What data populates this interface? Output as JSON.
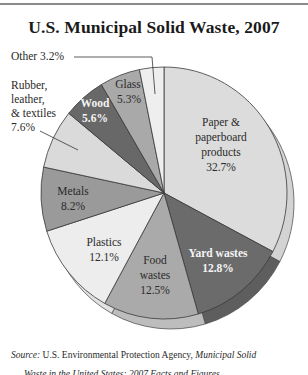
{
  "header": {
    "title": "U.S. Municipal Solid Waste, 2007"
  },
  "external_labels": {
    "other": "Other 3.2%",
    "rubber_line1": "Rubber,",
    "rubber_line2": "leather,",
    "rubber_line3": "& textiles",
    "rubber_line4": "7.6%"
  },
  "slice_labels": {
    "paper_line1": "Paper &",
    "paper_line2": "paperboard",
    "paper_line3": "products",
    "paper_line4": "32.7%",
    "yard_line1": "Yard wastes",
    "yard_line2": "12.8%",
    "food_line1": "Food",
    "food_line2": "wastes",
    "food_line3": "12.5%",
    "plastics_line1": "Plastics",
    "plastics_line2": "12.1%",
    "metals_line1": "Metals",
    "metals_line2": "8.2%",
    "wood_line1": "Wood",
    "wood_line2": "5.6%",
    "glass_line1": "Glass",
    "glass_line2": "5.3%"
  },
  "footer": {
    "source_label": "Source:",
    "source_text": " U.S. Environmental Protection Agency, ",
    "source_title": "Municipal Solid",
    "source_line2": "Waste in the United States: 2007 Facts and Figures"
  },
  "chart_data": {
    "type": "pie",
    "title": "U.S. Municipal Solid Waste, 2007",
    "start_angle_deg": 0,
    "direction": "clockwise",
    "unit": "%",
    "categories": [
      "Paper & paperboard products",
      "Yard wastes",
      "Food wastes",
      "Plastics",
      "Metals",
      "Rubber, leather, & textiles",
      "Wood",
      "Glass",
      "Other"
    ],
    "values": [
      32.7,
      12.8,
      12.5,
      12.1,
      8.2,
      7.6,
      5.6,
      5.3,
      3.2
    ],
    "colors": [
      "#dcdcdc",
      "#6b6b6b",
      "#aaaaaa",
      "#ededed",
      "#9a9a9a",
      "#dadada",
      "#686868",
      "#a9a9a9",
      "#eeeeee"
    ],
    "rim_colors": [
      "#d3d3d3",
      "#5e5e5e",
      "#bdbdbd",
      "#e2e2e2",
      "#8e8e8e",
      "#cfcfcf",
      "#5e5e5e",
      "#9d9d9d",
      "#e4e4e4"
    ],
    "annotation": "Source: U.S. Environmental Protection Agency, Municipal Solid Waste in the United States: 2007 Facts and Figures"
  }
}
